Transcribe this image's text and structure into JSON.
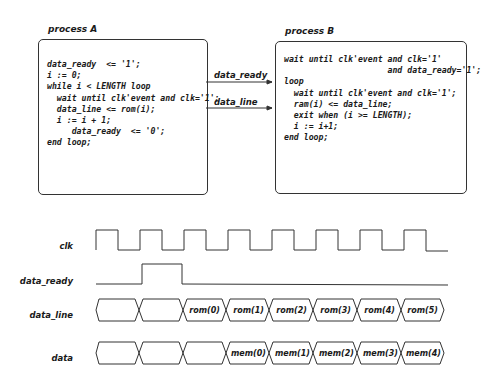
{
  "process_a": {
    "title": "process A",
    "code": "data_ready  <= '1';\ni := 0;\nwhile i < LENGTH loop\n  wait until clk'event and clk='1';\n  data_line <= rom(i);\n  i := i + 1;\n     data_ready  <= '0';\nend loop;"
  },
  "process_b": {
    "title": "process B",
    "code": "wait until clk'event and clk='1'\n                     and data_ready='1';\nloop\n  wait until clk'event and clk='1';\n  ram(i) <= data_line;\n  exit when (i >= LENGTH);\n  i := i+1;\nend loop;"
  },
  "wires": [
    {
      "label": "data_ready"
    },
    {
      "label": "data_line"
    }
  ],
  "timing": {
    "signals": [
      {
        "name": "clk"
      },
      {
        "name": "data_ready"
      },
      {
        "name": "data_line",
        "segments": [
          "",
          "",
          "rom(0)",
          "rom(1)",
          "rom(2)",
          "rom(3)",
          "rom(4)",
          "rom(5)"
        ]
      },
      {
        "name": "data",
        "segments": [
          "",
          "",
          "",
          "mem(0)",
          "mem(1)",
          "mem(2)",
          "mem(3)",
          "mem(4)"
        ]
      }
    ]
  },
  "colors": {
    "line": "#333333",
    "text": "#1a1a1a",
    "background": "#ffffff"
  }
}
